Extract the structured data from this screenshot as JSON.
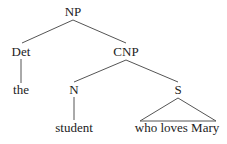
{
  "diagram": {
    "type": "syntax-tree",
    "nodes": {
      "np": {
        "label": "NP",
        "x": 73,
        "y": 16
      },
      "det": {
        "label": "Det",
        "x": 21,
        "y": 56
      },
      "cnp": {
        "label": "CNP",
        "x": 126,
        "y": 56
      },
      "the": {
        "label": "the",
        "x": 21,
        "y": 94
      },
      "n": {
        "label": "N",
        "x": 74,
        "y": 94
      },
      "s": {
        "label": "S",
        "x": 178,
        "y": 94
      },
      "student": {
        "label": "student",
        "x": 74,
        "y": 132
      },
      "who_loves_mary": {
        "label": "who loves Mary",
        "x": 177,
        "y": 132
      }
    },
    "edges": [
      {
        "from": "NP",
        "to": "Det"
      },
      {
        "from": "NP",
        "to": "CNP"
      },
      {
        "from": "Det",
        "to": "the"
      },
      {
        "from": "CNP",
        "to": "N"
      },
      {
        "from": "CNP",
        "to": "S"
      },
      {
        "from": "N",
        "to": "student"
      },
      {
        "from": "S",
        "to": "who loves Mary",
        "style": "triangle"
      }
    ],
    "colors": {
      "text": "#222222",
      "line": "#555555",
      "background": "#ffffff"
    }
  }
}
